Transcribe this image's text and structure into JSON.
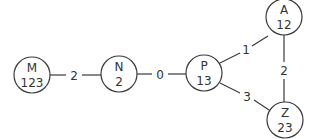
{
  "diagram": {
    "type": "graph",
    "nodes": [
      {
        "id": "M",
        "name": "M",
        "value": "123"
      },
      {
        "id": "N",
        "name": "N",
        "value": "2"
      },
      {
        "id": "P",
        "name": "P",
        "value": "13"
      },
      {
        "id": "A",
        "name": "A",
        "value": "12"
      },
      {
        "id": "Z",
        "name": "Z",
        "value": "23"
      }
    ],
    "edges": [
      {
        "from": "M",
        "to": "N",
        "weight": "2"
      },
      {
        "from": "N",
        "to": "P",
        "weight": "0"
      },
      {
        "from": "P",
        "to": "A",
        "weight": "1"
      },
      {
        "from": "A",
        "to": "Z",
        "weight": "2"
      },
      {
        "from": "P",
        "to": "Z",
        "weight": "3"
      }
    ]
  }
}
